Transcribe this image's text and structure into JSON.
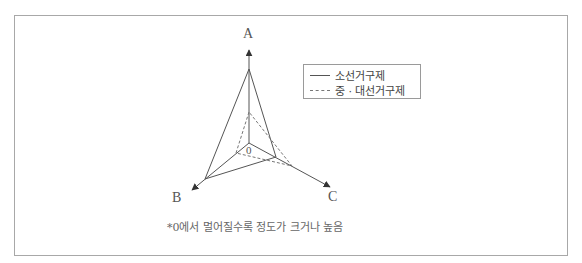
{
  "diagram": {
    "axes": {
      "a_label": "A",
      "b_label": "B",
      "c_label": "C",
      "origin_label": "0"
    },
    "legend": {
      "items": [
        {
          "label": "소선거구제",
          "style": "solid"
        },
        {
          "label": "중 · 대선거구제",
          "style": "dashed"
        }
      ]
    },
    "footnote": "*0에서 멀어질수록 정도가 크거나 높음",
    "colors": {
      "line": "#555555",
      "dashed": "#777777",
      "frame": "#a8a8a8"
    }
  }
}
